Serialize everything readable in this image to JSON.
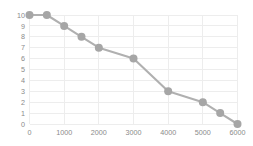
{
  "chart_data": {
    "type": "line",
    "title": "",
    "subtitle": "",
    "xlabel": "",
    "ylabel": "",
    "x": [
      0,
      500,
      1000,
      1500,
      2000,
      3000,
      4000,
      5000,
      5500,
      6000
    ],
    "values": [
      10,
      10,
      9,
      8,
      7,
      6,
      3,
      2,
      1,
      0
    ],
    "series": [
      {
        "name": "",
        "x": [
          0,
          500,
          1000,
          1500,
          2000,
          3000,
          4000,
          5000,
          5500,
          6000
        ],
        "values": [
          10,
          10,
          9,
          8,
          7,
          6,
          3,
          2,
          1,
          0
        ]
      }
    ],
    "points": [
      {
        "x": 0,
        "y": 10
      },
      {
        "x": 500,
        "y": 10
      },
      {
        "x": 1000,
        "y": 9
      },
      {
        "x": 1500,
        "y": 8
      },
      {
        "x": 2000,
        "y": 7
      },
      {
        "x": 3000,
        "y": 6
      },
      {
        "x": 4000,
        "y": 3
      },
      {
        "x": 5000,
        "y": 2
      },
      {
        "x": 5500,
        "y": 1
      },
      {
        "x": 6000,
        "y": 0
      }
    ],
    "xlim": [
      0,
      6000
    ],
    "ylim": [
      0,
      10
    ],
    "xticks": [
      0,
      1000,
      2000,
      3000,
      4000,
      5000,
      6000
    ],
    "yticks": [
      0,
      1,
      2,
      3,
      4,
      5,
      6,
      7,
      8,
      9,
      10
    ],
    "xtick_labels": [
      "0",
      "1000",
      "2000",
      "3000",
      "4000",
      "5000",
      "6000"
    ],
    "ytick_labels": [
      "0",
      "1",
      "2",
      "3",
      "4",
      "5",
      "6",
      "7",
      "8",
      "9",
      "10"
    ],
    "grid": true,
    "grid_x": true,
    "grid_y": true,
    "legend": false,
    "legend_position": "none",
    "markers": true,
    "marker_shape": "circle",
    "annotations": [],
    "colors": {
      "background": "#ffffff",
      "plot_background": "#ffffff",
      "line": "#b0b0b0",
      "marker": "#a6a6a6",
      "grid": "#ededed",
      "axis_text": "#8a8a8a"
    }
  }
}
